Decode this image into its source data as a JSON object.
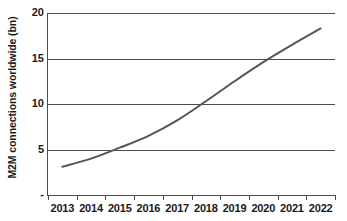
{
  "chart_data": {
    "type": "line",
    "title": "",
    "xlabel": "",
    "ylabel": "M2M connections worldwide (bn)",
    "categories": [
      "2013",
      "2014",
      "2015",
      "2016",
      "2017",
      "2018",
      "2019",
      "2020",
      "2021",
      "2022"
    ],
    "series": [
      {
        "name": "M2M connections worldwide (bn)",
        "color": "#555555",
        "values": [
          3.1,
          4.0,
          5.2,
          6.5,
          8.2,
          10.3,
          12.5,
          14.6,
          16.5,
          18.3
        ]
      }
    ],
    "ylim": [
      0,
      20
    ],
    "yticks": [
      0,
      5,
      10,
      15,
      20
    ],
    "ytick_labels": [
      "-",
      "5",
      "10",
      "15",
      "20"
    ],
    "grid": "horizontal",
    "legend": "none",
    "annotations": []
  },
  "axes": {
    "y_title": "M2M connections worldwide (bn)",
    "y_tick_labels": [
      "20",
      "15",
      "10",
      "5",
      "-"
    ],
    "x_tick_labels": [
      "2013",
      "2014",
      "2015",
      "2016",
      "2017",
      "2018",
      "2019",
      "2020",
      "2021",
      "2022"
    ]
  },
  "colors": {
    "series_line": "#555555",
    "axis": "#4d4d4d",
    "gridline": "#4d4d4d",
    "text": "#1a1a1a",
    "background": "#ffffff"
  }
}
